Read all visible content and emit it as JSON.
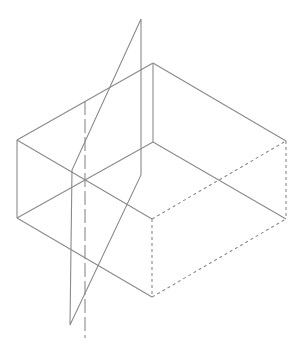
{
  "diagram": {
    "type": "isometric-box-with-cutting-plane",
    "colors": {
      "background": "#ffffff",
      "line": "#8a8a8a"
    },
    "box": {
      "vertices": {
        "top_left": [
          17,
          140
        ],
        "top_back": [
          153,
          63
        ],
        "top_right": [
          286,
          141
        ],
        "top_front": [
          152,
          219
        ],
        "bottom_left": [
          17,
          218
        ],
        "bottom_back": [
          153,
          142
        ],
        "bottom_right": [
          286,
          219
        ],
        "bottom_front": [
          152,
          297
        ]
      },
      "solid_edges": [
        [
          "top_left",
          "top_back"
        ],
        [
          "top_back",
          "top_right"
        ],
        [
          "top_left",
          "top_front"
        ],
        [
          "top_left",
          "bottom_left"
        ],
        [
          "top_back",
          "bottom_back"
        ],
        [
          "bottom_back",
          "bottom_left"
        ],
        [
          "bottom_back",
          "bottom_right"
        ],
        [
          "bottom_left",
          "bottom_front"
        ]
      ],
      "hidden_edges": [
        [
          "top_front",
          "top_right"
        ],
        [
          "top_right",
          "bottom_right"
        ],
        [
          "top_front",
          "bottom_front"
        ],
        [
          "bottom_front",
          "bottom_right"
        ]
      ]
    },
    "cutting_plane": {
      "points": [
        [
          141,
          19
        ],
        [
          72,
          170
        ],
        [
          70,
          325
        ],
        [
          141,
          175
        ]
      ]
    },
    "center_axis": {
      "from": [
        85,
        101
      ],
      "to": [
        85,
        338
      ]
    }
  }
}
